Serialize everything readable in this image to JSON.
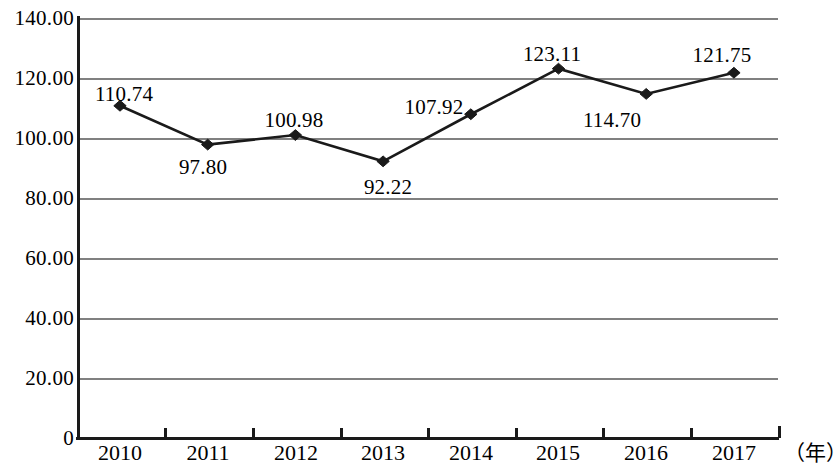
{
  "chart_data": {
    "type": "line",
    "title": "",
    "subtitle": "",
    "xlabel": "（年）",
    "ylabel": "",
    "categories": [
      "2010",
      "2011",
      "2012",
      "2013",
      "2014",
      "2015",
      "2016",
      "2017"
    ],
    "values": [
      110.74,
      97.8,
      100.98,
      92.22,
      107.92,
      123.11,
      114.7,
      121.75
    ],
    "data_labels": [
      "110.74",
      "97.80",
      "100.98",
      "92.22",
      "107.92",
      "123.11",
      "114.70",
      "121.75"
    ],
    "label_positions": [
      "above-left",
      "below-right",
      "above-left",
      "below",
      "above-left",
      "above",
      "below-left",
      "above-left"
    ],
    "ylim": [
      0,
      140
    ],
    "ytick_labels": [
      "0",
      "20.00",
      "40.00",
      "60.00",
      "80.00",
      "100.00",
      "120.00",
      "140.00"
    ],
    "ytick_values": [
      0,
      20,
      40,
      60,
      80,
      100,
      120,
      140
    ],
    "grid": "horizontal",
    "legend": "none",
    "marker": "diamond",
    "line_color": "#1a1a1a",
    "grid_color": "#808080",
    "axis_color": "#1a1a1a"
  }
}
